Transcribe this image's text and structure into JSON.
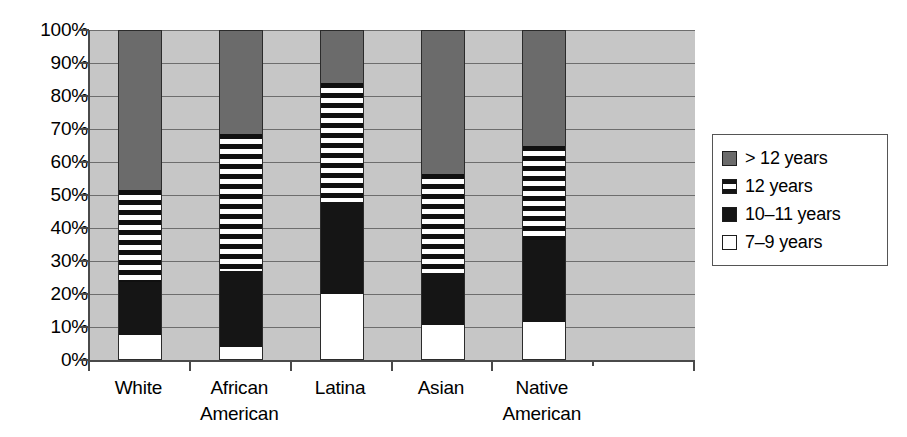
{
  "chart_data": {
    "type": "bar",
    "subtype": "100% stacked column",
    "title": "",
    "xlabel": "",
    "ylabel": "",
    "ylim": [
      0,
      100
    ],
    "ytick_labels": [
      "100%",
      "90%",
      "80%",
      "70%",
      "60%",
      "50%",
      "40%",
      "30%",
      "20%",
      "10%",
      "0%"
    ],
    "ytick_values": [
      100,
      90,
      80,
      70,
      60,
      50,
      40,
      30,
      20,
      10,
      0
    ],
    "grid": "horizontal",
    "legend_position": "right",
    "categories": [
      "White",
      "African American",
      "Latina",
      "Asian",
      "Native American"
    ],
    "category_lines": [
      [
        "White",
        ""
      ],
      [
        "African",
        "American"
      ],
      [
        "Latina",
        ""
      ],
      [
        "Asian",
        ""
      ],
      [
        "Native",
        "American"
      ]
    ],
    "series": [
      {
        "name": "7–9 years",
        "fill": "white",
        "values": [
          7.5,
          4.0,
          20.0,
          10.5,
          11.5
        ]
      },
      {
        "name": "10–11 years",
        "fill": "black",
        "values": [
          16.0,
          23.0,
          28.0,
          16.0,
          25.0
        ]
      },
      {
        "name": "12 years",
        "fill": "horizontal-stripes",
        "values": [
          28.0,
          41.5,
          36.0,
          30.0,
          28.5
        ]
      },
      {
        "name": "> 12 years",
        "fill": "gray",
        "values": [
          48.5,
          31.5,
          16.0,
          43.5,
          35.0
        ]
      }
    ],
    "cumulative_tops": {
      "White": [
        7.5,
        23.5,
        51.5,
        100
      ],
      "African American": [
        4.0,
        27.0,
        68.5,
        100
      ],
      "Latina": [
        20.0,
        48.0,
        84.0,
        100
      ],
      "Asian": [
        10.5,
        26.5,
        56.5,
        100
      ],
      "Native American": [
        11.5,
        36.5,
        65.0,
        100
      ]
    },
    "empty_category_slots": 1
  },
  "legend": {
    "entries": [
      {
        "label": "> 12 years",
        "swatch": "gray-swatch"
      },
      {
        "label": "12 years",
        "swatch": "striped-swatch"
      },
      {
        "label": "10–11 years",
        "swatch": "black-swatch"
      },
      {
        "label": "7–9 years",
        "swatch": "white-swatch"
      }
    ]
  },
  "colors": {
    "plot_background": "#c6c6c6",
    "gridline": "#6d6d6d",
    "axis": "#4a4a4a",
    "series_gray": "#6b6b6b",
    "series_black": "#151515",
    "series_white": "#ffffff",
    "page_background": "#ffffff"
  }
}
